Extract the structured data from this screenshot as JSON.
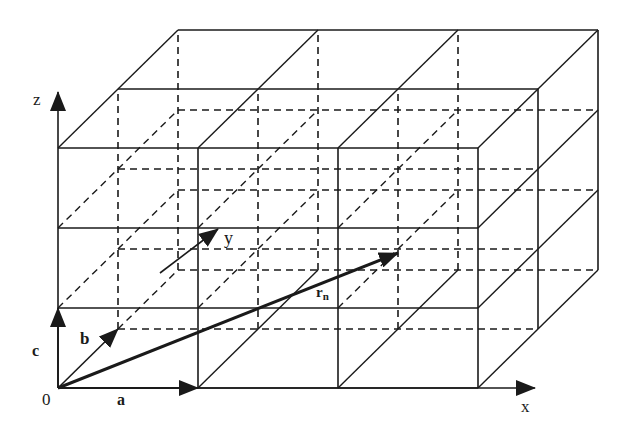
{
  "figure": {
    "ink_color": "#1a1a1a",
    "background": "#ffffff"
  },
  "geometry": {
    "origin": [
      58,
      388
    ],
    "a": [
      140,
      0
    ],
    "b": [
      60,
      -59
    ],
    "c": [
      0,
      -80
    ],
    "cells": {
      "x": 3,
      "y": 2,
      "z": 3
    }
  },
  "axes": {
    "x": {
      "label": "x",
      "from": [
        478,
        388
      ],
      "to": [
        535,
        388
      ],
      "label_pos": [
        521,
        412
      ]
    },
    "z": {
      "label": "z",
      "from": [
        58,
        148
      ],
      "to": [
        58,
        92
      ],
      "label_pos": [
        33,
        105
      ]
    },
    "y": {
      "label": "y",
      "label_pos": [
        224,
        244
      ]
    }
  },
  "vectors": {
    "a": {
      "label": "a",
      "from": [
        58,
        388
      ],
      "to": [
        198,
        388
      ],
      "label_pos": [
        117,
        405
      ]
    },
    "b": {
      "label": "b",
      "from": [
        58,
        388
      ],
      "to": [
        118,
        329
      ],
      "label_pos": [
        80,
        344
      ]
    },
    "c": {
      "label": "c",
      "from": [
        58,
        388
      ],
      "to": [
        58,
        308
      ],
      "label_pos": [
        32,
        356
      ]
    },
    "y_dir": {
      "from": [
        160,
        273
      ],
      "to": [
        218,
        229
      ]
    },
    "r_n": {
      "label": "r",
      "subscript": "n",
      "from": [
        58,
        388
      ],
      "to": [
        398,
        253
      ],
      "label_pos": [
        316,
        297
      ]
    }
  },
  "labels": {
    "origin": {
      "text": "0",
      "pos": [
        42,
        405
      ]
    }
  }
}
